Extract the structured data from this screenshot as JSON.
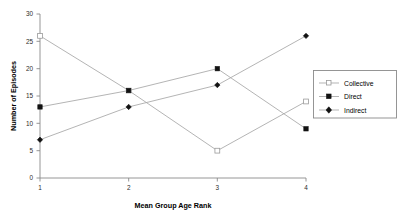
{
  "chart_data": {
    "type": "line",
    "title": "",
    "xlabel": "Mean Group Age Rank",
    "ylabel": "Number of Episodes",
    "x": [
      1,
      2,
      3,
      4
    ],
    "categories": [
      "1",
      "2",
      "3",
      "4"
    ],
    "xtick_labels": [
      "1",
      "2",
      "3",
      "4"
    ],
    "ytick_labels": [
      "0",
      "5",
      "10",
      "15",
      "20",
      "25",
      "30"
    ],
    "ytick_values": [
      0,
      5,
      10,
      15,
      20,
      25,
      30
    ],
    "xlim": [
      1,
      4
    ],
    "ylim": [
      0,
      30
    ],
    "grid": false,
    "legend_position": "right",
    "series": [
      {
        "name": "Collective",
        "values": [
          26,
          16,
          5,
          14
        ],
        "marker": "open-square",
        "color": "#9a9a9a"
      },
      {
        "name": "Direct",
        "values": [
          13,
          16,
          20,
          9
        ],
        "marker": "filled-square",
        "color": "#121212"
      },
      {
        "name": "Indirect",
        "values": [
          7,
          13,
          17,
          26
        ],
        "marker": "filled-diamond",
        "color": "#121212"
      }
    ]
  },
  "legend": {
    "entries": [
      {
        "label": "Collective"
      },
      {
        "label": "Direct"
      },
      {
        "label": "Indirect"
      }
    ]
  },
  "axes": {
    "x_title": "Mean Group Age Rank",
    "y_title": "Number of Episodes"
  }
}
